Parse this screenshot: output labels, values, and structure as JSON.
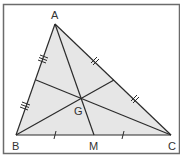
{
  "diagram": {
    "colors": {
      "frame": "#6b6b6b",
      "line": "#2b2b2b",
      "fill": "#e6e6e6",
      "background": "#ffffff"
    },
    "points": {
      "A": {
        "label": "A",
        "x": 55,
        "y": 24
      },
      "B": {
        "label": "B",
        "x": 16,
        "y": 135
      },
      "C": {
        "label": "C",
        "x": 171,
        "y": 135
      },
      "M": {
        "label": "M",
        "x": 94,
        "y": 135
      },
      "G": {
        "label": "G",
        "x": 81,
        "y": 98
      },
      "midAB": {
        "x": 36,
        "y": 80
      },
      "midAC": {
        "x": 114,
        "y": 80
      }
    },
    "segments": [
      {
        "name": "side-AB",
        "from": "A",
        "to": "B"
      },
      {
        "name": "side-AC",
        "from": "A",
        "to": "C"
      },
      {
        "name": "side-BC",
        "from": "B",
        "to": "C"
      },
      {
        "name": "median-AM",
        "from": "A",
        "to": "M"
      },
      {
        "name": "median-B-midAC",
        "from": "B",
        "to": "midAC"
      },
      {
        "name": "median-C-midAB",
        "from": "C",
        "to": "midAB"
      }
    ],
    "tick_marks": {
      "AB": "triple",
      "AC": "double",
      "BC": "single"
    }
  }
}
